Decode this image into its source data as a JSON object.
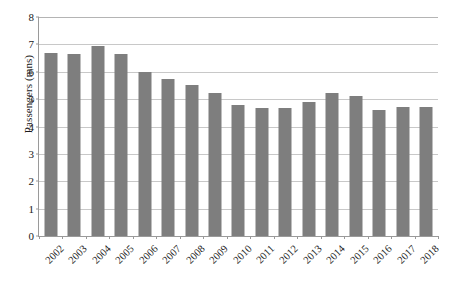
{
  "chart_data": {
    "type": "bar",
    "title": "",
    "xlabel": "",
    "ylabel": "Passengers (mns)",
    "ylim": [
      0,
      8
    ],
    "yticks": [
      0,
      1,
      2,
      3,
      4,
      5,
      6,
      7,
      8
    ],
    "ytick_labels": [
      "0",
      "1",
      "2",
      "3",
      "4",
      "5",
      "6",
      "7",
      "8"
    ],
    "grid": true,
    "grid_axis": "y",
    "legend": false,
    "legend_position": "none",
    "bar_color": "#7e7e7e",
    "categories": [
      "2002",
      "2003",
      "2004",
      "2005",
      "2006",
      "2007",
      "2008",
      "2009",
      "2010",
      "2011",
      "2012",
      "2013",
      "2014",
      "2015",
      "2016",
      "2017",
      "2018"
    ],
    "values": [
      6.67,
      6.65,
      6.93,
      6.65,
      5.99,
      5.73,
      5.53,
      5.23,
      4.78,
      4.67,
      4.66,
      4.9,
      5.24,
      5.1,
      4.6,
      4.7,
      4.7
    ]
  }
}
